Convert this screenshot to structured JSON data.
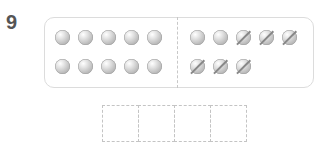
{
  "question": {
    "number": "9"
  },
  "counting_frame": {
    "left_group": {
      "row1_count": 5,
      "row2_count": 5,
      "crossed": 0
    },
    "right_group": {
      "row1": [
        "plain",
        "plain",
        "crossed",
        "crossed",
        "crossed"
      ],
      "row2": [
        "crossed",
        "crossed",
        "crossed"
      ]
    },
    "total_balls": 18,
    "crossed_out": 6
  },
  "answer_boxes": {
    "count": 4,
    "values": [
      "",
      "",
      "",
      ""
    ]
  },
  "colors": {
    "ball": "#b9b9b9",
    "panel_border": "#dcdcdc",
    "box_border": "#c4c4c4",
    "number": "#555555"
  }
}
